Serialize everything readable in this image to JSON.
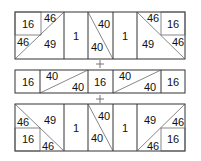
{
  "diagram": {
    "title": "",
    "colors": {
      "line": "#333333",
      "text": "#111111",
      "background": "#ffffff"
    },
    "top_block": {
      "cells": [
        {
          "label_a": "16",
          "label_b": "46",
          "label_c": "46",
          "label_d": "49"
        },
        {
          "label": "1"
        },
        {
          "label_a": "40",
          "label_b": "40"
        },
        {
          "label": "1"
        },
        {
          "label_a": "46",
          "label_b": "16",
          "label_c": "49",
          "label_d": "46"
        }
      ]
    },
    "operator_1": "+",
    "middle_block": {
      "cells": [
        {
          "label": "16"
        },
        {
          "label_a": "40",
          "label_b": "40"
        },
        {
          "label": "16"
        },
        {
          "label_a": "40",
          "label_b": "40"
        },
        {
          "label": "16"
        }
      ]
    },
    "operator_2": "+",
    "bottom_block": {
      "cells": [
        {
          "label_a": "46",
          "label_b": "49",
          "label_c": "16",
          "label_d": "46"
        },
        {
          "label": "1"
        },
        {
          "label_a": "40",
          "label_b": "40"
        },
        {
          "label": "1"
        },
        {
          "label_a": "49",
          "label_b": "46",
          "label_c": "16",
          "label_d": "46"
        }
      ]
    }
  }
}
